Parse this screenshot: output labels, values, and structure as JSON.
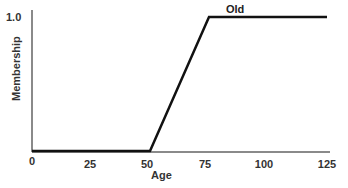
{
  "chart_data": {
    "type": "line",
    "title": "",
    "xlabel": "Age",
    "ylabel": "Membership",
    "xlim": [
      0,
      125
    ],
    "ylim": [
      0,
      1.0
    ],
    "x_ticks": [
      "0",
      "25",
      "50",
      "75",
      "100",
      "125"
    ],
    "y_ticks": [
      "1.0"
    ],
    "grid": false,
    "series": [
      {
        "name": "Old",
        "x": [
          0,
          50,
          75,
          125
        ],
        "values": [
          0,
          0,
          1.0,
          1.0
        ]
      }
    ],
    "annotations": [
      {
        "text": "Old",
        "x": 87,
        "y": 1.0
      }
    ]
  },
  "labels": {
    "xlabel": "Age",
    "ylabel": "Membership",
    "ytick_top": "1.0",
    "series_name": "Old",
    "xticks": [
      "0",
      "25",
      "50",
      "75",
      "100",
      "125"
    ]
  },
  "colors": {
    "axis": "#8a8a8a",
    "line": "#111111",
    "text": "#333333"
  }
}
